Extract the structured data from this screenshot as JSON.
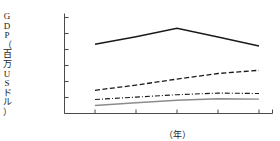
{
  "title_remnant": "",
  "axes": {
    "y_title_chars": [
      "G",
      "D",
      "P",
      "（",
      "百",
      "万",
      "U",
      "S",
      "ド",
      "ル",
      "）"
    ],
    "y_title_text": "GDP（百万USドル）",
    "x_title": "（年）"
  },
  "chart_data": {
    "type": "line",
    "title": "",
    "xlabel": "（年）",
    "ylabel": "GDP（百万USドル）",
    "categories": [
      "2005",
      "2006",
      "2007",
      "2008",
      "2009"
    ],
    "x": [
      2005,
      2006,
      2007,
      2008,
      2009
    ],
    "xlim": [
      2005,
      2009
    ],
    "ylim": [
      0,
      1200000
    ],
    "ytick_labels": [
      "0",
      "200,000",
      "400,000",
      "600,000",
      "800,000",
      "1,000,000",
      "1,200,000"
    ],
    "ytick_values": [
      0,
      200000,
      400000,
      600000,
      800000,
      1000000,
      1200000
    ],
    "xtick_labels": [
      "2005",
      "2006",
      "2007",
      "2008",
      "2009"
    ],
    "grid": false,
    "legend": "none",
    "series": [
      {
        "name": "series-1",
        "style": "solid",
        "color": "#1a1a1a",
        "width": 1.5,
        "values": [
          865000,
          960000,
          1065000,
          955000,
          845000
        ]
      },
      {
        "name": "series-2",
        "style": "dashed",
        "color": "#1a1a1a",
        "width": 1.3,
        "values": [
          290000,
          355000,
          430000,
          500000,
          540000
        ]
      },
      {
        "name": "series-3",
        "style": "dashdot",
        "color": "#1a1a1a",
        "width": 1.1,
        "values": [
          175000,
          205000,
          235000,
          255000,
          250000
        ]
      },
      {
        "name": "series-4",
        "style": "solid",
        "color": "#8c8c8c",
        "width": 1.4,
        "values": [
          100000,
          135000,
          165000,
          185000,
          180000
        ]
      }
    ]
  }
}
